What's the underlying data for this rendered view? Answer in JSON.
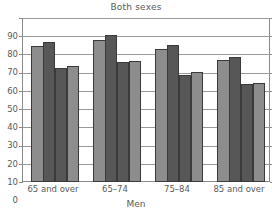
{
  "chart_data": {
    "type": "bar",
    "title": "Both sexes",
    "xlabel": "Men",
    "ylabel": "",
    "ylim": [
      0,
      90
    ],
    "yticks": [
      0,
      10,
      20,
      30,
      40,
      50,
      60,
      70,
      80,
      90
    ],
    "ytick_labels": [
      "0",
      "10",
      "20",
      "30",
      "40",
      "50",
      "60",
      "70",
      "80",
      "90"
    ],
    "grid": true,
    "legend": "none",
    "categories": [
      "65 and over",
      "65–74",
      "75–84",
      "85 and over"
    ],
    "series": [
      {
        "name": "Series 1",
        "shade": "light",
        "values": [
          74.5,
          78.0,
          73.0,
          67.0
        ]
      },
      {
        "name": "Series 2",
        "shade": "dark",
        "values": [
          77.0,
          80.5,
          75.0,
          68.5
        ]
      },
      {
        "name": "Series 3",
        "shade": "dark",
        "values": [
          62.5,
          66.0,
          59.0,
          54.0
        ]
      },
      {
        "name": "Series 4",
        "shade": "light",
        "values": [
          63.5,
          66.5,
          60.5,
          54.5
        ]
      }
    ],
    "colors": {
      "light_bar": "#8d8d8d",
      "dark_bar": "#575757",
      "bar_edge": "#3a3a3a",
      "gridline": "#9a9a9a",
      "axis": "#8a8a8a",
      "text": "#5a5a5a",
      "background": "#ffffff"
    }
  }
}
